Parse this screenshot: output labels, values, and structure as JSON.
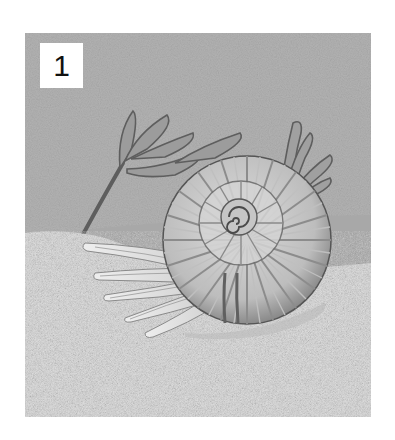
{
  "illustration": {
    "badge_number": "1",
    "subject": "ammonite resting on sandy sea floor with seaweed",
    "colors": {
      "water": "#b3b3b3",
      "far_seabed": "#a6a6a6",
      "sand": "#dedede",
      "shell_light": "#e8e8e8",
      "shell_dark": "#6e6e6e",
      "seaweed": "#8f8f8f"
    }
  }
}
